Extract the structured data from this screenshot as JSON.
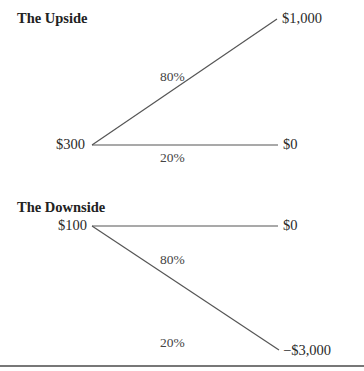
{
  "upside": {
    "title": "The Upside",
    "start_value": "$300",
    "branches": [
      {
        "probability": "80%",
        "outcome": "$1,000"
      },
      {
        "probability": "20%",
        "outcome": "$0"
      }
    ]
  },
  "downside": {
    "title": "The Downside",
    "start_value": "$100",
    "branches": [
      {
        "probability": "80%",
        "outcome": "$0"
      },
      {
        "probability": "20%",
        "outcome": "−$3,000"
      }
    ]
  },
  "colors": {
    "line": "#555555",
    "text": "#2a2a2a"
  }
}
